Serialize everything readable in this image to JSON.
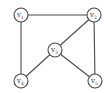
{
  "diagram": {
    "type": "undirected-graph",
    "colors": {
      "stroke": "#4a4a4a",
      "fill": "#ffffff",
      "text": "#333333"
    },
    "node_radius": 7,
    "nodes": [
      {
        "id": "v1",
        "base": "v",
        "sub": "1",
        "x": 21,
        "y": 15
      },
      {
        "id": "v2",
        "base": "v",
        "sub": "2",
        "x": 94,
        "y": 15
      },
      {
        "id": "v3",
        "base": "v",
        "sub": "3",
        "x": 55,
        "y": 50
      },
      {
        "id": "v4",
        "base": "v",
        "sub": "4",
        "x": 21,
        "y": 81
      },
      {
        "id": "v5",
        "base": "v",
        "sub": "5",
        "x": 95,
        "y": 81
      }
    ],
    "edges": [
      {
        "from": "v1",
        "to": "v2"
      },
      {
        "from": "v1",
        "to": "v4"
      },
      {
        "from": "v2",
        "to": "v3"
      },
      {
        "from": "v2",
        "to": "v5"
      },
      {
        "from": "v3",
        "to": "v4"
      },
      {
        "from": "v3",
        "to": "v5"
      }
    ]
  }
}
